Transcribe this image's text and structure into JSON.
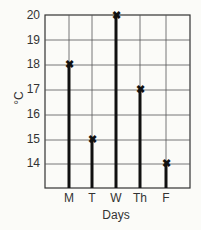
{
  "chart_data": {
    "type": "bar",
    "style": "stick plot with x markers",
    "title": "",
    "xlabel": "Days",
    "ylabel": "°C",
    "categories": [
      "M",
      "T",
      "W",
      "Th",
      "F"
    ],
    "values": [
      18,
      15,
      20,
      17,
      14
    ],
    "ylim": [
      13,
      20
    ],
    "yticks": [
      "14",
      "15",
      "16",
      "17",
      "18",
      "19",
      "20"
    ],
    "grid": true,
    "legend": null
  }
}
